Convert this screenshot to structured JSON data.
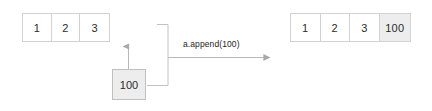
{
  "diagram": {
    "background_color": "#ffffff",
    "line_color": "#b0b0b0",
    "box_border_color": "#d2d2d2",
    "shaded_cell_color": "#ededed",
    "text_color": "#2b2b2b",
    "operation_label": "a.append(100)",
    "array_before": {
      "name": "original-list",
      "cells": [
        {
          "value": "1",
          "shaded": false
        },
        {
          "value": "2",
          "shaded": false
        },
        {
          "value": "3",
          "shaded": false
        }
      ]
    },
    "appended_value": {
      "name": "appended-element",
      "value": "100",
      "shaded": true
    },
    "array_after": {
      "name": "resulting-list",
      "cells": [
        {
          "value": "1",
          "shaded": false
        },
        {
          "value": "2",
          "shaded": false
        },
        {
          "value": "3",
          "shaded": false
        },
        {
          "value": "100",
          "shaded": true
        }
      ]
    },
    "connectors": [
      {
        "name": "insert-arrow-up",
        "direction": "up"
      },
      {
        "name": "grouping-bracket",
        "direction": "vertical"
      },
      {
        "name": "transform-arrow-right",
        "direction": "right"
      }
    ]
  }
}
